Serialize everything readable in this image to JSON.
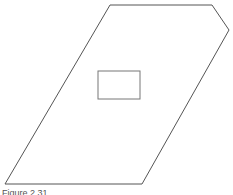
{
  "figure": {
    "caption": "Figure 2.31",
    "stroke_color": "#555555",
    "outer_shape": {
      "type": "polygon",
      "points": [
        [
          110,
          5
        ],
        [
          212,
          5
        ],
        [
          229,
          30
        ],
        [
          142,
          184
        ],
        [
          5,
          184
        ]
      ]
    },
    "inner_rect": {
      "x": 98,
      "y": 71,
      "width": 42,
      "height": 28
    }
  }
}
